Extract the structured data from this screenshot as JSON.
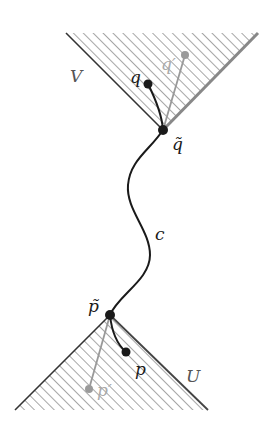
{
  "diagram": {
    "colors": {
      "ink": "#1a1a1a",
      "gray": "#9a9a9a",
      "hatch": "#777777",
      "background": "#ffffff"
    },
    "regions": [
      {
        "id": "V",
        "label": "V",
        "shape": "upward-opening cone (hatched)",
        "apex": "q-tilde"
      },
      {
        "id": "U",
        "label": "U",
        "shape": "downward-opening cone (hatched)",
        "apex": "p-tilde"
      }
    ],
    "points": [
      {
        "id": "q",
        "label": "q",
        "color": "black"
      },
      {
        "id": "q-prime",
        "label": "q′",
        "color": "gray"
      },
      {
        "id": "q-tilde",
        "label": "q̃",
        "color": "black"
      },
      {
        "id": "p-tilde",
        "label": "p̃",
        "color": "black"
      },
      {
        "id": "p",
        "label": "p",
        "color": "black"
      },
      {
        "id": "p-prime",
        "label": "p′",
        "color": "gray"
      }
    ],
    "curves": [
      {
        "id": "c",
        "label": "c",
        "from": "p-tilde",
        "to": "q-tilde",
        "style": "wavy black curve"
      }
    ],
    "labels": {
      "V": "V",
      "U": "U",
      "q": "q",
      "q_prime": "q′",
      "q_tilde": "q̃",
      "p_tilde": "p̃",
      "p": "p",
      "p_prime": "p′",
      "c": "c"
    }
  }
}
